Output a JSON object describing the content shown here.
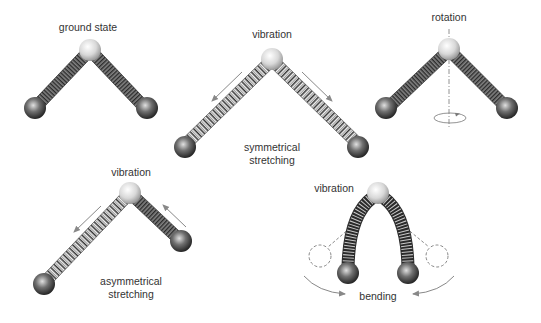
{
  "panels": {
    "ground": {
      "label": "ground state"
    },
    "symmetric": {
      "label": "vibration",
      "caption_line1": "symmetrical",
      "caption_line2": "stretching"
    },
    "rotation": {
      "label": "rotation"
    },
    "asymmetric": {
      "label": "vibration",
      "caption_line1": "asymmetrical",
      "caption_line2": "stretching"
    },
    "bending": {
      "label": "vibration",
      "caption": "bending"
    }
  },
  "colors": {
    "background": "#ffffff",
    "text": "#333333",
    "arrow": "#888888",
    "spring_dark": "#2a2a2a",
    "spring_light": "#f2f2f2",
    "atom_center": "#e6e6e6",
    "atom_outer": "#3a3a3a"
  }
}
